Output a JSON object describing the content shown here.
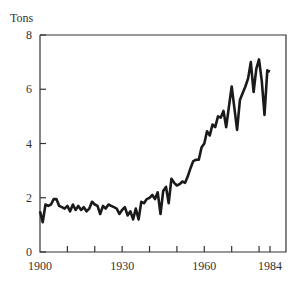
{
  "chart_data": {
    "type": "line",
    "title": "",
    "xlabel": "",
    "ylabel": "Tons",
    "xlim": [
      1900,
      1986
    ],
    "ylim": [
      0,
      8
    ],
    "x_ticks": [
      1910,
      1920,
      1930,
      1940,
      1950,
      1960,
      1970,
      1980,
      1984
    ],
    "x_tick_labels": [
      "1900",
      "1930",
      "1960",
      "1984"
    ],
    "y_tick_labels": [
      "0",
      "2",
      "4",
      "6",
      "8"
    ],
    "y_ticks": [
      0,
      2,
      4,
      6,
      8
    ],
    "grid": false,
    "legend": null,
    "series": [
      {
        "name": "Tons",
        "x": [
          1900,
          1901,
          1902,
          1903,
          1904,
          1905,
          1906,
          1907,
          1908,
          1909,
          1910,
          1911,
          1912,
          1913,
          1914,
          1915,
          1916,
          1917,
          1918,
          1919,
          1920,
          1921,
          1922,
          1923,
          1924,
          1925,
          1926,
          1927,
          1928,
          1929,
          1930,
          1931,
          1932,
          1933,
          1934,
          1935,
          1936,
          1937,
          1938,
          1939,
          1940,
          1941,
          1942,
          1943,
          1944,
          1945,
          1946,
          1947,
          1948,
          1949,
          1950,
          1951,
          1952,
          1953,
          1954,
          1955,
          1956,
          1957,
          1958,
          1959,
          1960,
          1961,
          1962,
          1963,
          1964,
          1965,
          1966,
          1967,
          1968,
          1969,
          1970,
          1971,
          1972,
          1973,
          1974,
          1975,
          1976,
          1977,
          1978,
          1979,
          1980,
          1981,
          1982,
          1983,
          1984
        ],
        "values": [
          1.5,
          1.1,
          1.75,
          1.7,
          1.75,
          1.95,
          1.95,
          1.7,
          1.65,
          1.6,
          1.7,
          1.5,
          1.75,
          1.55,
          1.7,
          1.55,
          1.65,
          1.5,
          1.6,
          1.85,
          1.75,
          1.7,
          1.4,
          1.7,
          1.6,
          1.75,
          1.7,
          1.65,
          1.6,
          1.4,
          1.55,
          1.65,
          1.35,
          1.5,
          1.2,
          1.6,
          1.2,
          1.85,
          1.8,
          1.95,
          2.0,
          2.1,
          1.95,
          2.2,
          1.4,
          2.25,
          2.4,
          1.8,
          2.7,
          2.55,
          2.45,
          2.5,
          2.6,
          2.55,
          2.8,
          3.1,
          3.35,
          3.4,
          3.4,
          3.85,
          4.0,
          4.45,
          4.3,
          4.7,
          4.6,
          5.0,
          4.95,
          5.2,
          4.6,
          5.35,
          6.1,
          5.3,
          4.5,
          5.6,
          5.85,
          6.1,
          6.4,
          7.0,
          5.9,
          6.75,
          7.1,
          6.3,
          5.05,
          6.7,
          6.65
        ]
      }
    ]
  },
  "axes": {
    "ylabel": "Tons",
    "x_labels": [
      {
        "value": 1900,
        "text": "1900"
      },
      {
        "value": 1930,
        "text": "1930"
      },
      {
        "value": 1960,
        "text": "1960"
      },
      {
        "value": 1984,
        "text": "1984"
      }
    ],
    "y_labels": [
      {
        "value": 0,
        "text": "0"
      },
      {
        "value": 2,
        "text": "2"
      },
      {
        "value": 4,
        "text": "4"
      },
      {
        "value": 6,
        "text": "6"
      },
      {
        "value": 8,
        "text": "8"
      }
    ]
  },
  "colors": {
    "line": "#1a1a1a",
    "axis": "#333333"
  }
}
